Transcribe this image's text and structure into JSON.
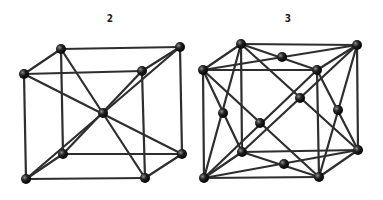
{
  "figures": [
    {
      "label": "2",
      "label_pos": [
        110,
        22
      ],
      "nodes": {
        "btl": [
          61,
          49
        ],
        "btr": [
          180,
          47
        ],
        "ftl": [
          24,
          74
        ],
        "ftr": [
          142,
          71
        ],
        "c": [
          103,
          113
        ],
        "bbl": [
          63,
          154
        ],
        "bbr": [
          182,
          154
        ],
        "fbl": [
          26,
          179
        ],
        "fbr": [
          145,
          178
        ]
      },
      "edges": [
        [
          "btl",
          "btr"
        ],
        [
          "ftl",
          "ftr"
        ],
        [
          "btl",
          "ftl"
        ],
        [
          "btr",
          "ftr"
        ],
        [
          "bbl",
          "bbr"
        ],
        [
          "fbl",
          "fbr"
        ],
        [
          "bbl",
          "fbl"
        ],
        [
          "bbr",
          "fbr"
        ],
        [
          "btl",
          "bbl"
        ],
        [
          "btr",
          "bbr"
        ],
        [
          "ftl",
          "fbl"
        ],
        [
          "ftr",
          "fbr"
        ],
        [
          "btl",
          "fbr"
        ],
        [
          "btr",
          "fbl"
        ],
        [
          "ftl",
          "bbr"
        ],
        [
          "ftr",
          "bbl"
        ]
      ]
    },
    {
      "label": "3",
      "label_pos": [
        288,
        22
      ],
      "nodes": {
        "btl": [
          241,
          44
        ],
        "btr": [
          357,
          45
        ],
        "ftl": [
          203,
          70
        ],
        "ftr": [
          317,
          70
        ],
        "top": [
          282,
          57
        ],
        "back": [
          300,
          98
        ],
        "left": [
          223,
          113
        ],
        "front": [
          260,
          123
        ],
        "right": [
          338,
          110
        ],
        "bbl": [
          242,
          152
        ],
        "bbr": [
          358,
          150
        ],
        "bottom": [
          284,
          164
        ],
        "fbl": [
          204,
          178
        ],
        "fbr": [
          319,
          177
        ]
      },
      "edges": [
        [
          "btl",
          "btr"
        ],
        [
          "ftl",
          "ftr"
        ],
        [
          "btl",
          "ftl"
        ],
        [
          "btr",
          "ftr"
        ],
        [
          "bbl",
          "bbr"
        ],
        [
          "fbl",
          "fbr"
        ],
        [
          "bbl",
          "fbl"
        ],
        [
          "bbr",
          "fbr"
        ],
        [
          "btl",
          "bbl"
        ],
        [
          "btr",
          "bbr"
        ],
        [
          "ftl",
          "fbl"
        ],
        [
          "ftr",
          "fbr"
        ],
        [
          "btl",
          "ftr"
        ],
        [
          "ftl",
          "btr"
        ],
        [
          "bbl",
          "fbr"
        ],
        [
          "fbl",
          "bbr"
        ],
        [
          "btl",
          "bbr"
        ],
        [
          "btr",
          "bbl"
        ],
        [
          "ftl",
          "fbr"
        ],
        [
          "ftr",
          "fbl"
        ],
        [
          "btl",
          "fbl"
        ],
        [
          "ftl",
          "bbl"
        ],
        [
          "btr",
          "fbr"
        ],
        [
          "ftr",
          "bbr"
        ]
      ]
    }
  ],
  "colors": {
    "edge": "#2e2e2e",
    "node": "#111111",
    "background": "#ffffff"
  }
}
